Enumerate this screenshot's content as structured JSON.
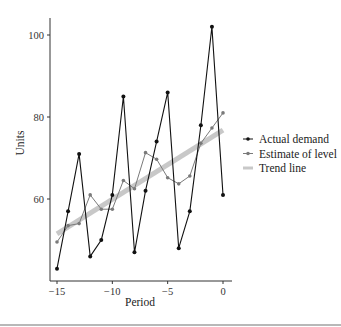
{
  "chart_data": {
    "type": "line",
    "title": "",
    "xlabel": "Period",
    "ylabel": "Units",
    "xlim": [
      -15.6,
      0.8
    ],
    "ylim": [
      40.5,
      104
    ],
    "xticks": [
      -15,
      -10,
      -5,
      0
    ],
    "xtick_labels": [
      "−15",
      "−10",
      "−5",
      "0"
    ],
    "yticks": [
      60,
      80,
      100
    ],
    "ytick_labels": [
      "60",
      "80",
      "100"
    ],
    "grid": false,
    "legend_position": "right",
    "x": [
      -15,
      -14,
      -13,
      -12,
      -11,
      -10,
      -9,
      -8,
      -7,
      -6,
      -5,
      -4,
      -3,
      -2,
      -1,
      0
    ],
    "series": [
      {
        "name": "Actual demand",
        "color": "#111111",
        "kind": "line-markers",
        "values": [
          43,
          57,
          71,
          46,
          50,
          61,
          85,
          47,
          62,
          74,
          86,
          48,
          57,
          78,
          102,
          61
        ]
      },
      {
        "name": "Estimate of level",
        "color": "#7a7a7a",
        "kind": "line-markers",
        "values": [
          49.5,
          53.5,
          54,
          61,
          57.5,
          57.5,
          64.5,
          62.5,
          71.3,
          69.7,
          65.2,
          63.7,
          65.6,
          73.6,
          77.3,
          81
        ]
      },
      {
        "name": "Trend line",
        "color": "#c8c8c8",
        "kind": "thick-line",
        "x": [
          -15,
          0
        ],
        "values": [
          51.5,
          76.8
        ]
      }
    ]
  }
}
